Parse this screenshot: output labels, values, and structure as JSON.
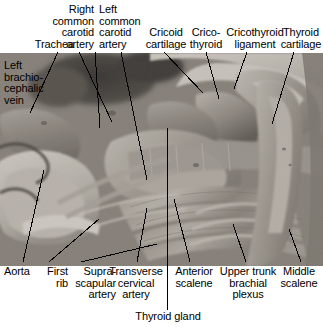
{
  "figure": {
    "kind": "labeled-anatomical-photograph",
    "region": "root of neck / thoracic inlet, anterolateral dissection",
    "colors": {
      "background": "#ffffff",
      "text": "#000000",
      "leader_line": "#000000",
      "photo_tone": "grayscale"
    }
  },
  "labels": {
    "trachea": "Trachea",
    "right_common_carotid_artery": "Right\ncommon\ncarotid\nartery",
    "left_common_carotid_artery": "Left\ncommon\ncarotid\nartery",
    "cricoid_cartilage": "Cricoid\ncartilage",
    "cricothyroid": "Crico-\nthyroid",
    "cricothyroid_ligament": "Cricothyroid\nligament",
    "thyroid_cartilage": "Thyroid\ncartilage",
    "left_brachiocephalic_vein": "Left\nbrachio-\ncephalic\nvein",
    "aorta": "Aorta",
    "first_rib": "First\nrib",
    "suprascapular_artery": "Supra-\nscapular\nartery",
    "transverse_cervical_artery": "Transverse\ncervical\nartery",
    "anterior_scalene": "Anterior\nscalene",
    "upper_trunk_brachial_plexus": "Upper trunk\nbrachial\nplexus",
    "middle_scalene": "Middle\nscalene",
    "thyroid_gland": "Thyroid gland"
  }
}
